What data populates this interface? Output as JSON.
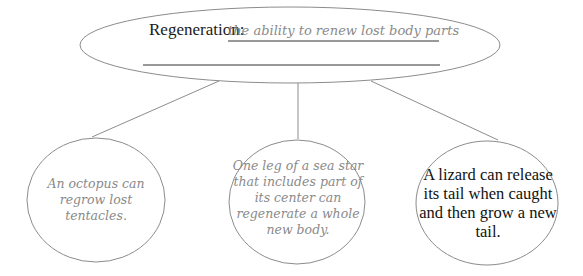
{
  "central": {
    "term": "Regeneration:",
    "definition": "the ability to renew lost body parts"
  },
  "examples": [
    {
      "text": "An octopus can regrow lost tentacles.",
      "style": "handwritten"
    },
    {
      "text": "One leg of a sea star that includes part of its center can regenerate a whole new body.",
      "style": "handwritten"
    },
    {
      "text": "A lizard can release its tail when caught and then grow a new tail.",
      "style": "typed"
    }
  ],
  "colors": {
    "outline": "#8c8c8c",
    "rule_line": "#333333",
    "handwriting": "#8a8a8a",
    "typed_text": "#111111"
  }
}
